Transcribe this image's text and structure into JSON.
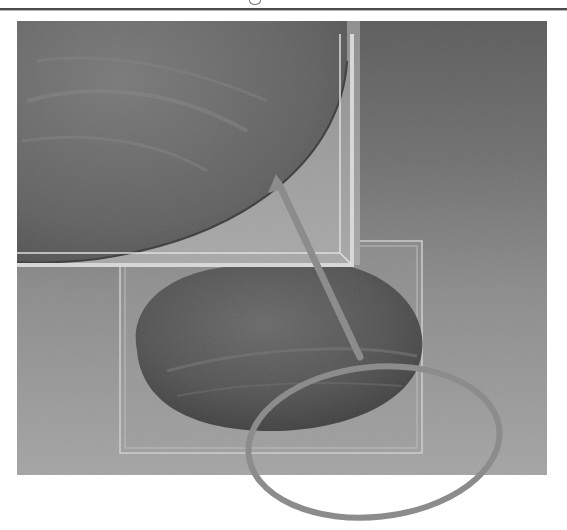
{
  "figure": {
    "colors": {
      "background_top": "#5d5d5d",
      "background_bottom": "#a5a5a5",
      "inset_fill": "#9f9f9f",
      "surface_dark": "#4a4a4a",
      "frame_line": "#d8d8d8",
      "arrow": "#888888",
      "ring": "#8a8a8a"
    },
    "inset": {
      "x": 17,
      "y": 21,
      "width": 343,
      "height": 244
    },
    "selection_box": {
      "x": 120,
      "y": 241,
      "width": 302,
      "height": 212
    },
    "arrow": {
      "from": [
        360,
        357
      ],
      "to": [
        276,
        178
      ]
    },
    "ring": {
      "cx": 374,
      "cy": 442,
      "rx": 127,
      "ry": 76
    }
  }
}
